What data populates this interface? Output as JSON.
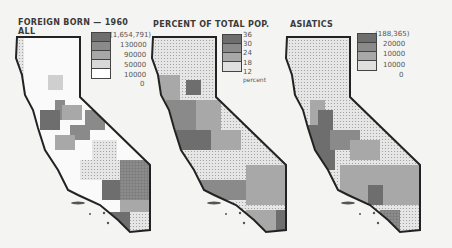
{
  "maps": [
    {
      "title_line1": "FOREIGN BORN — 1960",
      "title_line2": "ALL",
      "legend": {
        "labels": [
          "(1,654,791)",
          "130000",
          "90000",
          "50000",
          "10000",
          "0"
        ],
        "colors": [
          "#6e6e6e",
          "#8a8a8a",
          "#a8a8a8",
          "#cfcfcf",
          "#ffffff"
        ]
      }
    },
    {
      "title_line1": "PERCENT OF TOTAL POP.",
      "legend": {
        "labels": [
          "36",
          "30",
          "24",
          "18",
          "12"
        ],
        "unit": "percent",
        "colors": [
          "#6e6e6e",
          "#8a8a8a",
          "#a8a8a8",
          "#d8d8d8"
        ]
      }
    },
    {
      "title_line1": "ASIATICS",
      "legend": {
        "labels": [
          "(188,365)",
          "20000",
          "10000",
          "10000",
          "0"
        ],
        "colors": [
          "#6e6e6e",
          "#8a8a8a",
          "#a8a8a8",
          "#d8d8d8"
        ]
      }
    }
  ]
}
